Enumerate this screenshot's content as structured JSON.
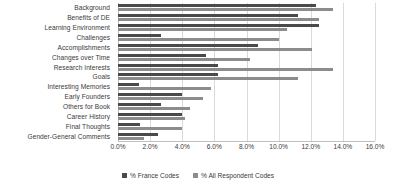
{
  "chart_data": {
    "type": "bar",
    "orientation": "horizontal",
    "title": "",
    "xlabel": "",
    "ylabel": "",
    "xlim": [
      0,
      16
    ],
    "xticks": [
      "0.0%",
      "2.0%",
      "4.0%",
      "6.0%",
      "8.0%",
      "10.0%",
      "12.0%",
      "14.0%",
      "16.0%"
    ],
    "xtick_values": [
      0,
      2,
      4,
      6,
      8,
      10,
      12,
      14,
      16
    ],
    "grid": true,
    "legend_position": "bottom",
    "categories": [
      "Background",
      "Benefits of DE",
      "Learning Environment",
      "Challenges",
      "Accomplishments",
      "Changes over Time",
      "Research Interests",
      "Goals",
      "Interesting Memories",
      "Early Founders",
      "Others for Book",
      "Career History",
      "Final Thoughts",
      "Gender-General Comments"
    ],
    "series": [
      {
        "name": "% France Codes",
        "color": "#4a4a4a",
        "values": [
          12.3,
          11.2,
          12.5,
          2.7,
          8.7,
          5.5,
          6.2,
          6.2,
          1.3,
          4.0,
          2.7,
          4.0,
          1.4,
          2.5
        ]
      },
      {
        "name": "% All Respondent Codes",
        "color": "#8c8c8c",
        "values": [
          13.4,
          12.5,
          10.5,
          10.0,
          12.1,
          8.2,
          13.4,
          11.2,
          5.8,
          5.3,
          4.5,
          4.2,
          4.0,
          1.6
        ]
      }
    ]
  },
  "legend": {
    "items": [
      {
        "label": "% France Codes"
      },
      {
        "label": "% All Respondent Codes"
      }
    ]
  }
}
